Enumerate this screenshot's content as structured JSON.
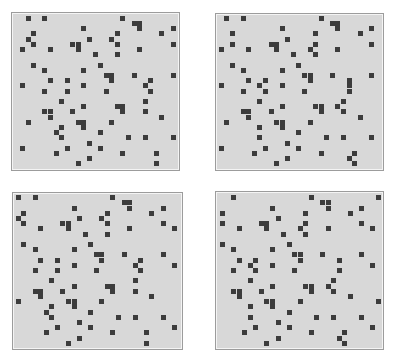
{
  "figure": {
    "cell_color": "#3c3c3c",
    "background_color": "#d8d8d8",
    "border_color": "#9c9c9c",
    "col_pitch": 5.57,
    "row_pitch": 5.2,
    "panels": [
      {
        "id": "panel-1",
        "box": {
          "left": 11,
          "top": 12,
          "width": 169,
          "height": 159
        },
        "grid_origin": {
          "x": 20.2,
          "y": 15.8
        },
        "cells": [
          [
            0,
            1
          ],
          [
            0,
            4
          ],
          [
            0,
            18
          ],
          [
            1,
            20
          ],
          [
            1,
            21
          ],
          [
            2,
            11
          ],
          [
            2,
            21
          ],
          [
            2,
            27
          ],
          [
            3,
            2
          ],
          [
            3,
            17
          ],
          [
            3,
            25
          ],
          [
            4,
            1
          ],
          [
            4,
            12
          ],
          [
            4,
            16
          ],
          [
            5,
            2
          ],
          [
            5,
            9
          ],
          [
            5,
            10
          ],
          [
            5,
            17
          ],
          [
            5,
            27
          ],
          [
            6,
            0
          ],
          [
            6,
            5
          ],
          [
            6,
            10
          ],
          [
            6,
            21
          ],
          [
            7,
            13
          ],
          [
            7,
            17
          ],
          [
            9,
            2
          ],
          [
            9,
            14
          ],
          [
            10,
            4
          ],
          [
            10,
            11
          ],
          [
            11,
            15
          ],
          [
            11,
            16
          ],
          [
            11,
            20
          ],
          [
            11,
            27
          ],
          [
            12,
            5
          ],
          [
            12,
            8
          ],
          [
            12,
            16
          ],
          [
            12,
            23
          ],
          [
            13,
            0
          ],
          [
            13,
            11
          ],
          [
            13,
            22
          ],
          [
            14,
            4
          ],
          [
            14,
            8
          ],
          [
            14,
            15
          ],
          [
            14,
            23
          ],
          [
            16,
            7
          ],
          [
            16,
            22
          ],
          [
            17,
            11
          ],
          [
            17,
            17
          ],
          [
            17,
            18
          ],
          [
            18,
            4
          ],
          [
            18,
            5
          ],
          [
            18,
            9
          ],
          [
            18,
            18
          ],
          [
            18,
            22
          ],
          [
            19,
            5
          ],
          [
            19,
            25
          ],
          [
            20,
            1
          ],
          [
            20,
            10
          ],
          [
            20,
            11
          ],
          [
            20,
            16
          ],
          [
            21,
            7
          ],
          [
            21,
            11
          ],
          [
            22,
            6
          ],
          [
            22,
            14
          ],
          [
            23,
            7
          ],
          [
            23,
            19
          ],
          [
            23,
            22
          ],
          [
            23,
            27
          ],
          [
            24,
            12
          ],
          [
            25,
            0
          ],
          [
            25,
            8
          ],
          [
            25,
            14
          ],
          [
            26,
            6
          ],
          [
            26,
            18
          ],
          [
            26,
            24
          ],
          [
            27,
            12
          ],
          [
            28,
            10
          ],
          [
            28,
            24
          ]
        ]
      },
      {
        "id": "panel-2",
        "box": {
          "left": 215,
          "top": 13,
          "width": 169,
          "height": 158
        },
        "grid_origin": {
          "x": 218.5,
          "y": 15.8
        },
        "cells": [
          [
            0,
            1
          ],
          [
            0,
            4
          ],
          [
            0,
            18
          ],
          [
            1,
            20
          ],
          [
            1,
            21
          ],
          [
            2,
            11
          ],
          [
            2,
            21
          ],
          [
            2,
            27
          ],
          [
            3,
            2
          ],
          [
            3,
            17
          ],
          [
            3,
            25
          ],
          [
            4,
            12
          ],
          [
            5,
            2
          ],
          [
            5,
            9
          ],
          [
            5,
            10
          ],
          [
            5,
            17
          ],
          [
            5,
            27
          ],
          [
            6,
            0
          ],
          [
            6,
            5
          ],
          [
            6,
            10
          ],
          [
            6,
            16
          ],
          [
            6,
            21
          ],
          [
            7,
            13
          ],
          [
            7,
            17
          ],
          [
            9,
            2
          ],
          [
            9,
            14
          ],
          [
            10,
            4
          ],
          [
            10,
            11
          ],
          [
            11,
            15
          ],
          [
            11,
            16
          ],
          [
            11,
            20
          ],
          [
            11,
            27
          ],
          [
            12,
            5
          ],
          [
            12,
            8
          ],
          [
            12,
            16
          ],
          [
            12,
            23
          ],
          [
            13,
            0
          ],
          [
            13,
            7
          ],
          [
            13,
            11
          ],
          [
            13,
            23
          ],
          [
            14,
            4
          ],
          [
            14,
            8
          ],
          [
            14,
            15
          ],
          [
            14,
            23
          ],
          [
            16,
            7
          ],
          [
            16,
            22
          ],
          [
            17,
            11
          ],
          [
            17,
            17
          ],
          [
            17,
            18
          ],
          [
            17,
            21
          ],
          [
            18,
            4
          ],
          [
            18,
            5
          ],
          [
            18,
            9
          ],
          [
            18,
            18
          ],
          [
            18,
            22
          ],
          [
            19,
            5
          ],
          [
            19,
            25
          ],
          [
            20,
            1
          ],
          [
            20,
            10
          ],
          [
            20,
            11
          ],
          [
            20,
            16
          ],
          [
            21,
            7
          ],
          [
            21,
            11
          ],
          [
            22,
            14
          ],
          [
            23,
            7
          ],
          [
            23,
            19
          ],
          [
            23,
            22
          ],
          [
            23,
            27
          ],
          [
            24,
            12
          ],
          [
            25,
            0
          ],
          [
            25,
            8
          ],
          [
            25,
            14
          ],
          [
            26,
            6
          ],
          [
            26,
            18
          ],
          [
            26,
            24
          ],
          [
            27,
            12
          ],
          [
            27,
            23
          ],
          [
            28,
            10
          ],
          [
            28,
            24
          ]
        ]
      },
      {
        "id": "panel-3",
        "box": {
          "left": 12,
          "top": 192,
          "width": 171,
          "height": 158
        },
        "grid_origin": {
          "x": 15.8,
          "y": 195.2
        },
        "cells": [
          [
            0,
            0
          ],
          [
            0,
            3
          ],
          [
            0,
            17
          ],
          [
            1,
            19
          ],
          [
            1,
            20
          ],
          [
            2,
            10
          ],
          [
            2,
            20
          ],
          [
            2,
            26
          ],
          [
            3,
            1
          ],
          [
            3,
            16
          ],
          [
            3,
            24
          ],
          [
            4,
            0
          ],
          [
            4,
            11
          ],
          [
            4,
            15
          ],
          [
            5,
            1
          ],
          [
            5,
            8
          ],
          [
            5,
            9
          ],
          [
            5,
            16
          ],
          [
            5,
            26
          ],
          [
            6,
            4
          ],
          [
            6,
            9
          ],
          [
            6,
            20
          ],
          [
            6,
            28
          ],
          [
            7,
            12
          ],
          [
            7,
            16
          ],
          [
            9,
            1
          ],
          [
            9,
            13
          ],
          [
            10,
            3
          ],
          [
            10,
            10
          ],
          [
            11,
            14
          ],
          [
            11,
            15
          ],
          [
            11,
            19
          ],
          [
            11,
            26
          ],
          [
            12,
            4
          ],
          [
            12,
            7
          ],
          [
            12,
            15
          ],
          [
            12,
            22
          ],
          [
            13,
            10
          ],
          [
            13,
            21
          ],
          [
            13,
            28
          ],
          [
            14,
            3
          ],
          [
            14,
            7
          ],
          [
            14,
            14
          ],
          [
            14,
            22
          ],
          [
            16,
            6
          ],
          [
            16,
            21
          ],
          [
            17,
            10
          ],
          [
            17,
            16
          ],
          [
            17,
            17
          ],
          [
            18,
            3
          ],
          [
            18,
            4
          ],
          [
            18,
            8
          ],
          [
            18,
            17
          ],
          [
            18,
            21
          ],
          [
            19,
            4
          ],
          [
            19,
            24
          ],
          [
            20,
            0
          ],
          [
            20,
            9
          ],
          [
            20,
            10
          ],
          [
            20,
            15
          ],
          [
            21,
            6
          ],
          [
            21,
            10
          ],
          [
            22,
            5
          ],
          [
            22,
            13
          ],
          [
            23,
            6
          ],
          [
            23,
            18
          ],
          [
            23,
            21
          ],
          [
            23,
            26
          ],
          [
            24,
            11
          ],
          [
            25,
            7
          ],
          [
            25,
            13
          ],
          [
            25,
            28
          ],
          [
            26,
            5
          ],
          [
            26,
            17
          ],
          [
            26,
            23
          ],
          [
            27,
            11
          ],
          [
            28,
            9
          ],
          [
            28,
            23
          ]
        ]
      },
      {
        "id": "panel-4",
        "box": {
          "left": 215,
          "top": 191,
          "width": 169,
          "height": 159
        },
        "grid_origin": {
          "x": 219.8,
          "y": 195.2
        },
        "cells": [
          [
            0,
            2
          ],
          [
            0,
            16
          ],
          [
            0,
            28
          ],
          [
            1,
            18
          ],
          [
            1,
            19
          ],
          [
            2,
            9
          ],
          [
            2,
            19
          ],
          [
            2,
            25
          ],
          [
            3,
            0
          ],
          [
            3,
            15
          ],
          [
            3,
            23
          ],
          [
            4,
            10
          ],
          [
            5,
            0
          ],
          [
            5,
            7
          ],
          [
            5,
            8
          ],
          [
            5,
            15
          ],
          [
            5,
            25
          ],
          [
            6,
            3
          ],
          [
            6,
            8
          ],
          [
            6,
            14
          ],
          [
            6,
            19
          ],
          [
            6,
            27
          ],
          [
            7,
            11
          ],
          [
            7,
            15
          ],
          [
            9,
            0
          ],
          [
            9,
            12
          ],
          [
            10,
            2
          ],
          [
            10,
            9
          ],
          [
            11,
            13
          ],
          [
            11,
            14
          ],
          [
            11,
            18
          ],
          [
            11,
            25
          ],
          [
            12,
            3
          ],
          [
            12,
            6
          ],
          [
            12,
            14
          ],
          [
            12,
            21
          ],
          [
            13,
            5
          ],
          [
            13,
            9
          ],
          [
            13,
            27
          ],
          [
            14,
            2
          ],
          [
            14,
            6
          ],
          [
            14,
            13
          ],
          [
            14,
            21
          ],
          [
            16,
            5
          ],
          [
            16,
            20
          ],
          [
            17,
            9
          ],
          [
            17,
            15
          ],
          [
            17,
            16
          ],
          [
            17,
            19
          ],
          [
            18,
            2
          ],
          [
            18,
            3
          ],
          [
            18,
            7
          ],
          [
            18,
            16
          ],
          [
            18,
            20
          ],
          [
            19,
            3
          ],
          [
            19,
            23
          ],
          [
            20,
            8
          ],
          [
            20,
            9
          ],
          [
            20,
            14
          ],
          [
            20,
            28
          ],
          [
            21,
            5
          ],
          [
            21,
            9
          ],
          [
            22,
            12
          ],
          [
            23,
            5
          ],
          [
            23,
            17
          ],
          [
            23,
            20
          ],
          [
            23,
            25
          ],
          [
            24,
            10
          ],
          [
            25,
            6
          ],
          [
            25,
            12
          ],
          [
            25,
            27
          ],
          [
            26,
            4
          ],
          [
            26,
            16
          ],
          [
            26,
            22
          ],
          [
            27,
            10
          ],
          [
            27,
            21
          ],
          [
            28,
            8
          ],
          [
            28,
            22
          ]
        ]
      }
    ]
  }
}
